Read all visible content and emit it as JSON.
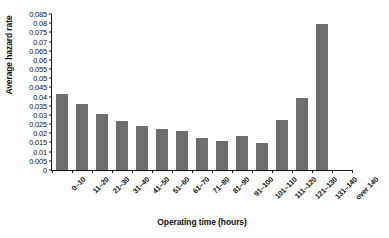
{
  "chart_data": {
    "type": "bar",
    "title": "",
    "xlabel": "Operating time (hours)",
    "ylabel": "Average hazard rate",
    "categories": [
      "0–10",
      "11–20",
      "21–30",
      "31–40",
      "41–50",
      "51–60",
      "61–70",
      "71–80",
      "81–90",
      "91–100",
      "101–110",
      "111–120",
      "121–130",
      "131–140",
      "over 140"
    ],
    "values": [
      0.0415,
      0.036,
      0.0305,
      0.0265,
      0.024,
      0.0225,
      0.021,
      0.0175,
      0.016,
      0.0185,
      0.0145,
      0.0275,
      0.0395,
      0.0795,
      0
    ],
    "ylim": [
      0,
      0.085
    ],
    "ytick_step": 0.005,
    "ytick_labels": [
      "0",
      "0.005",
      "0.01",
      "0.015",
      "0.02",
      "0.025",
      "0.03",
      "0.035",
      "0.04",
      "0.045",
      "0.05",
      "0.055",
      "0.06",
      "0.065",
      "0.07",
      "0.075",
      "0.08",
      "0.085"
    ],
    "ytick_values": [
      0,
      0.005,
      0.01,
      0.015,
      0.02,
      0.025,
      0.03,
      0.035,
      0.04,
      0.045,
      0.05,
      0.055,
      0.06,
      0.065,
      0.07,
      0.075,
      0.08,
      0.085
    ],
    "grid": false,
    "legend": "none",
    "bar_color": "#6e6e6e",
    "axis_color": "#1a1a1a",
    "background_color": "#ffffff"
  }
}
